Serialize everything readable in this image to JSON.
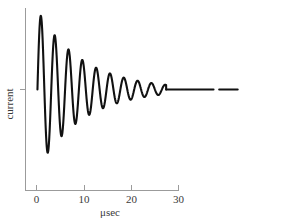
{
  "chart_data": {
    "type": "line",
    "title": "",
    "xlabel": "μsec",
    "ylabel": "current",
    "xlim": [
      -1.5,
      43
    ],
    "ylim": [
      -1.42,
      1.42
    ],
    "grid": false,
    "legend": null,
    "xticks": [
      0,
      10,
      20,
      30
    ],
    "xticklabels": [
      "0",
      "10",
      "20",
      "30"
    ],
    "yticks": [
      0
    ],
    "yticklabels": [
      ""
    ],
    "series": [
      {
        "name": "current",
        "color": "#111111",
        "model": "damped-sine",
        "amplitude": 1.28,
        "decay_constant_usec": 9.6,
        "period_usec": 2.92,
        "phase": 0,
        "start_x": 0.2,
        "settle_x": 27.4,
        "end_x": 42.5,
        "break_x_start": 37.4,
        "break_x_end": 38.6,
        "x": [
          0.2,
          1.0,
          1.9,
          3.4,
          5.0,
          6.4,
          7.9,
          9.3,
          10.8,
          12.2,
          13.7,
          15.1,
          16.6,
          18.0,
          19.5,
          20.9,
          22.4,
          23.8,
          25.3,
          26.7,
          27.4,
          30.0,
          35.0,
          40.0,
          42.5
        ],
        "y": [
          0.0,
          0.62,
          1.27,
          -1.02,
          0.93,
          -0.78,
          0.72,
          -0.59,
          0.55,
          -0.45,
          0.42,
          -0.34,
          0.31,
          -0.25,
          0.23,
          -0.18,
          0.16,
          -0.12,
          0.11,
          -0.05,
          0.0,
          0.0,
          0.0,
          0.0,
          0.0
        ]
      }
    ]
  },
  "axes": {
    "x_axis_name": "x-axis",
    "y_axis_name": "y-axis",
    "x_tick_labels": [
      "0",
      "10",
      "20",
      "30"
    ],
    "x_axis_title": "μsec",
    "y_axis_title": "current",
    "axis_color": "#9b9b9b",
    "curve_color": "#111111"
  }
}
